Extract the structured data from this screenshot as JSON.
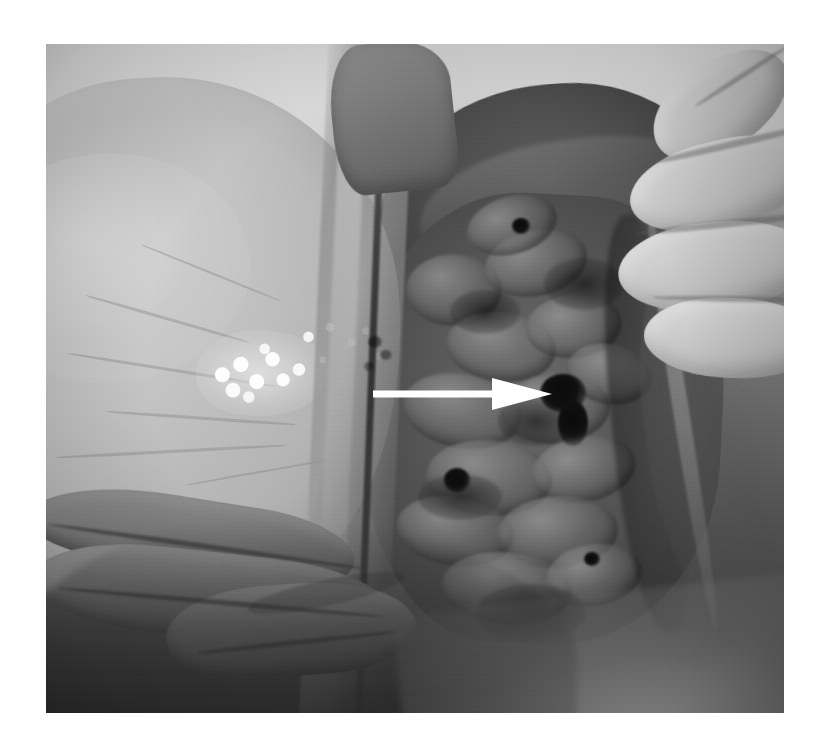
{
  "figure": {
    "domain": "Natural-Image",
    "kind": "gross-pathology-photograph",
    "description": "Black and white gross pathology photograph of an opened abdominal cavity showing a pale smooth organ surface on the left bearing a white granular nodular deposit, darker convoluted bowel loops at centre-right, and a gloved hand retracting tissue at the upper right.",
    "color_mode": "grayscale",
    "page_background": "#ffffff",
    "photo": {
      "left": 46,
      "top": 44,
      "width": 738,
      "height": 669,
      "border": "none",
      "dominant_tones": [
        "#d4d4d4",
        "#b8b8b8",
        "#8f8f8f",
        "#5a5a5a",
        "#3a3a3a",
        "#141414"
      ]
    }
  },
  "annotations": {
    "arrow": {
      "name": "white-pointer-arrow",
      "color": "#ffffff",
      "direction": "right",
      "shaft": {
        "x1": 327,
        "y1": 350,
        "x2": 450,
        "y2": 350,
        "thickness": 7
      },
      "head": {
        "base_x": 446,
        "tip_x": 506,
        "half_height": 16
      },
      "points_at": "dark focal lesion on the serosal surface at centre-right"
    }
  },
  "regions": [
    {
      "name": "background-drape",
      "label": "pale photographic backdrop",
      "tone": "#d2d2d2"
    },
    {
      "name": "pale-organ-left",
      "label": "smooth pale organ surface (liver)",
      "tone": "#c2c2c2"
    },
    {
      "name": "white-granular-deposit",
      "label": "white granular nodular deposit",
      "tone": "#f5f5f5"
    },
    {
      "name": "cut-edge-band",
      "label": "vertical cut/reflected tissue edge",
      "tone": "#8a8a8a"
    },
    {
      "name": "dark-mass-upper-right",
      "label": "dark tissue mass",
      "tone": "#4a4a4a"
    },
    {
      "name": "bowel-loops",
      "label": "convoluted bowel loops",
      "tone": "#505050"
    },
    {
      "name": "gloved-fingers",
      "label": "gloved fingers retracting tissue",
      "tone": "#cdcdcd"
    },
    {
      "name": "retracted-wall",
      "label": "retracted abdominal wall / peritoneum",
      "tone": "#7e7e7e"
    },
    {
      "name": "folded-tissue-lower-left",
      "label": "folded tissue at lower left",
      "tone": "#7a7a7a"
    }
  ],
  "text_content": {
    "caption": "",
    "labels": [],
    "note": "No rendered text, axis labels, legends, numbers or UI chrome appear in this image."
  }
}
